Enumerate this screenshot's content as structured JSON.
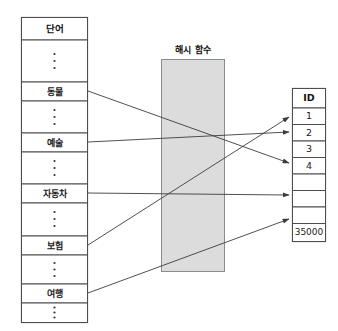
{
  "diagram": {
    "title_word_table": "단어",
    "title_hash_function": "해시 함수",
    "title_id_table": "ID",
    "ellipsis_glyph": "⋮",
    "colors": {
      "hash_box_fill": "#dcdcdc",
      "hash_box_stroke": "#8c8c8c",
      "cell_stroke": "#4d4d4d",
      "line_stroke": "#3c3c3c",
      "background": "#ffffff"
    }
  },
  "word_table": {
    "header": "단어",
    "rows": [
      {
        "type": "header",
        "label": "단어"
      },
      {
        "type": "ellipsis",
        "label": "⋮"
      },
      {
        "type": "word",
        "label": "동물"
      },
      {
        "type": "ellipsis",
        "label": "⋮"
      },
      {
        "type": "word",
        "label": "예술"
      },
      {
        "type": "ellipsis",
        "label": "⋮"
      },
      {
        "type": "word",
        "label": "자동차"
      },
      {
        "type": "ellipsis",
        "label": "⋮"
      },
      {
        "type": "word",
        "label": "보험"
      },
      {
        "type": "ellipsis",
        "label": "⋮"
      },
      {
        "type": "word",
        "label": "여행"
      },
      {
        "type": "ellipsis",
        "label": "⋮"
      }
    ]
  },
  "hash_function": {
    "label": "해시 함수"
  },
  "id_table": {
    "header": "ID",
    "rows": [
      {
        "type": "header",
        "label": "ID"
      },
      {
        "type": "id",
        "label": "1"
      },
      {
        "type": "id",
        "label": "2"
      },
      {
        "type": "id",
        "label": "3"
      },
      {
        "type": "id",
        "label": "4"
      },
      {
        "type": "empty",
        "label": ""
      },
      {
        "type": "empty",
        "label": ""
      },
      {
        "type": "empty",
        "label": ""
      },
      {
        "type": "id",
        "label": "35000"
      }
    ]
  },
  "mappings": [
    {
      "from": "동물",
      "to": "4"
    },
    {
      "from": "예술",
      "to": "2"
    },
    {
      "from": "자동차",
      "to": ""
    },
    {
      "from": "보험",
      "to": "1"
    },
    {
      "from": "여행",
      "to": ""
    }
  ]
}
